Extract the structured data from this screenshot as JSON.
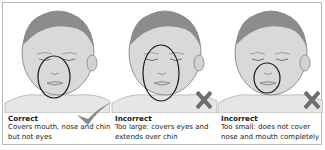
{
  "figure": {
    "panels": [
      {
        "id": "correct",
        "title": "Correct",
        "description": "Covers mouth, nose and chin but not eyes",
        "mark": "check-icon",
        "mask_fit": "correct"
      },
      {
        "id": "too-large",
        "title": "Incorrect",
        "description": "Too large: covers eyes and extends over chin",
        "mark": "x-icon",
        "mask_fit": "too-large"
      },
      {
        "id": "too-small",
        "title": "Incorrect",
        "description": "Too small: does not cover nose and mouth completely",
        "mark": "x-icon",
        "mask_fit": "too-small"
      }
    ],
    "colors": {
      "border": "#b8b8b8",
      "hair": "#8c8c8c",
      "skin": "#d9d9d9",
      "mask_outline": "#1a1a1a",
      "check": "#8a8a8a",
      "x_mark": "#6e6e6e"
    }
  }
}
